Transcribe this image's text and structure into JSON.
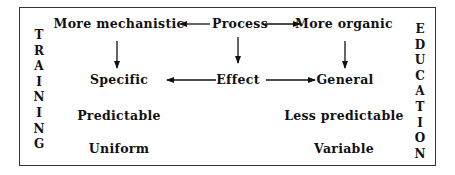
{
  "diagram": {
    "left_label": "TRAINING",
    "right_label": "EDUCATION",
    "row1": {
      "left": "More mechanistic",
      "center": "Process",
      "right": "More organic"
    },
    "row2": {
      "left": "Specific",
      "center": "Effect",
      "right": "General"
    },
    "row3": {
      "left": "Predictable",
      "right": "Less predictable"
    },
    "row4": {
      "left": "Uniform",
      "right": "Variable"
    }
  },
  "colors": {
    "ink": "#111111",
    "border": "#333333",
    "background": "#ffffff"
  }
}
